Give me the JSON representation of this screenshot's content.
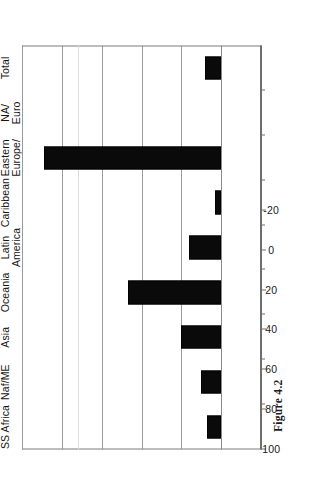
{
  "figure": {
    "caption": "Figure 4.2",
    "orientation": "rotated-90-ccw"
  },
  "chart_data": {
    "type": "bar",
    "orientation": "vertical",
    "title": "",
    "xlabel": "",
    "ylabel": "",
    "ylim": [
      -20,
      100
    ],
    "yticks": [
      100,
      80,
      60,
      40,
      20,
      0,
      -20
    ],
    "ytick_labels": [
      "100",
      "80",
      "60",
      "40",
      "20",
      "0",
      "-20"
    ],
    "grid": true,
    "legend": false,
    "categories": [
      "SS Africa",
      "Naf/ME",
      "Asia",
      "Oceania",
      "Latin\nAmerica",
      "Caribbean",
      "Eastern\nEurope/\nCA",
      "NA/\nEuro",
      "Total"
    ],
    "values": [
      7,
      10,
      20,
      47,
      16,
      3,
      89,
      0,
      8
    ],
    "bar_color": "#0a0a0a"
  }
}
